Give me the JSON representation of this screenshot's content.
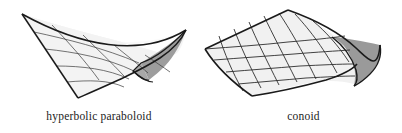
{
  "page": {
    "background_color": "#ffffff",
    "width": 402,
    "height": 133
  },
  "figures": [
    {
      "id": "hyperbolic-paraboloid",
      "caption": "hyperbolic paraboloid",
      "surface_type": "hyperbolic paraboloid",
      "description": "saddle-shaped ruled surface drawn as a warped quadrilateral mesh",
      "fill_color": "#f2f2f2",
      "shade_color": "#9a9a9a",
      "line_color": "#1a1a1a",
      "grid_lines": 5
    },
    {
      "id": "conoid",
      "caption": "conoid",
      "surface_type": "conoid",
      "description": "ruled surface with straight generators folding over a curved edge",
      "fill_color": "#efefef",
      "shade_color": "#8c8c8c",
      "line_color": "#1a1a1a",
      "grid_lines": 6
    }
  ],
  "colors": {
    "background": "#ffffff",
    "outline": "#1a1a1a",
    "surface_light": "#f2f2f2",
    "surface_shade": "#9a9a9a",
    "caption_text": "#222222"
  }
}
